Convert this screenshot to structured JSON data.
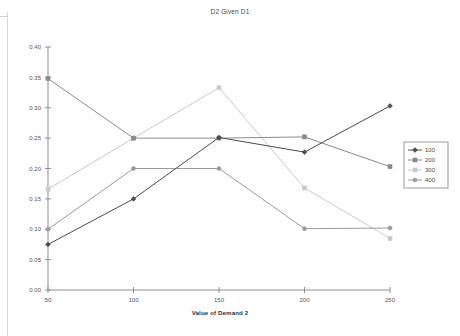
{
  "chart_data": {
    "type": "line",
    "title": "D2 Given D1",
    "xlabel": "Value of Demand 2",
    "ylabel": "",
    "x": [
      50,
      100,
      150,
      200,
      250
    ],
    "xtick_labels": [
      "50",
      "100",
      "150",
      "200",
      "250"
    ],
    "ytick_labels": [
      "0.00",
      "0.05",
      "0.10",
      "0.15",
      "0.20",
      "0.25",
      "0.30",
      "0.35",
      "0.40"
    ],
    "ytick_values": [
      0.0,
      0.05,
      0.1,
      0.15,
      0.2,
      0.25,
      0.3,
      0.35,
      0.4
    ],
    "xlim": [
      50,
      250
    ],
    "ylim": [
      0.0,
      0.4
    ],
    "grid": false,
    "legend_position": "right",
    "series": [
      {
        "name": "100",
        "values": [
          0.075,
          0.15,
          0.251,
          0.227,
          0.303
        ],
        "color": "#4c4c4c",
        "marker": "diamond"
      },
      {
        "name": "200",
        "values": [
          0.348,
          0.25,
          0.25,
          0.252,
          0.203
        ],
        "color": "#8a8a8a",
        "marker": "square"
      },
      {
        "name": "300",
        "values": [
          0.166,
          0.25,
          0.333,
          0.168,
          0.085
        ],
        "color": "#c9c9c9",
        "marker": "square"
      },
      {
        "name": "400",
        "values": [
          0.1,
          0.2,
          0.2,
          0.101,
          0.102
        ],
        "color": "#9b9b9b",
        "marker": "circle"
      }
    ]
  },
  "legend": {
    "entries": [
      "100",
      "200",
      "300",
      "400"
    ]
  }
}
